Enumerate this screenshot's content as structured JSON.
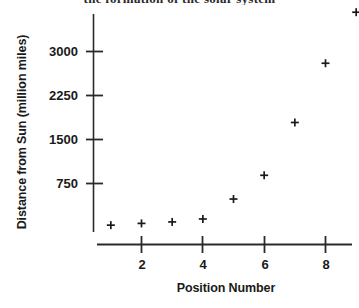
{
  "page": {
    "background_color": "#ffffff",
    "ink_color": "#1a1a1a",
    "top_cut_heading": "the formation of the solar system"
  },
  "chart_data": {
    "type": "scatter",
    "title": "",
    "xlabel": "Position Number",
    "ylabel": "Distance from Sun (million miles)",
    "xlim": [
      0.4,
      9.6
    ],
    "ylim": [
      -120,
      3850
    ],
    "grid": false,
    "legend": null,
    "marker": "plus",
    "marker_color": "#1a1a1a",
    "xticks": [
      2,
      4,
      6,
      8
    ],
    "xticklabels": [
      "2",
      "4",
      "6",
      "8"
    ],
    "yticks": [
      750,
      1500,
      2250,
      3000
    ],
    "yticklabels": [
      "750",
      "1500",
      "2250",
      "3000"
    ],
    "x": [
      1,
      2,
      3,
      4,
      5,
      6,
      7,
      8,
      9
    ],
    "y": [
      40,
      70,
      95,
      145,
      485,
      890,
      1790,
      2800,
      3670
    ],
    "points": [
      {
        "x": 1,
        "y": 40
      },
      {
        "x": 2,
        "y": 70
      },
      {
        "x": 3,
        "y": 95
      },
      {
        "x": 4,
        "y": 145
      },
      {
        "x": 5,
        "y": 485
      },
      {
        "x": 6,
        "y": 890
      },
      {
        "x": 7,
        "y": 1790
      },
      {
        "x": 8,
        "y": 2800
      },
      {
        "x": 9,
        "y": 3670
      }
    ]
  },
  "axis_titles": {
    "x": "Position Number",
    "y": "Distance from Sun (million miles)"
  },
  "y_tick_labels": [
    "3000",
    "2250",
    "1500",
    "750"
  ],
  "x_tick_labels": [
    "2",
    "4",
    "6",
    "8"
  ]
}
